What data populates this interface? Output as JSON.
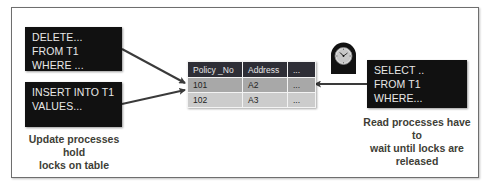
{
  "update_processes": {
    "boxes": [
      {
        "lines": [
          "DELETE...",
          "FROM T1",
          "WHERE ..."
        ]
      },
      {
        "lines": [
          "INSERT INTO T1",
          "VALUES..."
        ]
      }
    ],
    "caption_line1": "Update processes hold",
    "caption_line2": "locks on table"
  },
  "table": {
    "headers": [
      "Policy _No",
      "Address",
      "..."
    ],
    "rows": [
      [
        "101",
        "A2",
        "..."
      ],
      [
        "102",
        "A3",
        "..."
      ]
    ],
    "colors": {
      "header_bg": "#2e2e36",
      "row1_bg": "#a8a8a8",
      "row2_bg": "#cccccc"
    }
  },
  "read_process": {
    "box": {
      "lines": [
        "SELECT ..",
        "FROM T1",
        "WHERE..."
      ]
    },
    "caption_line1": "Read processes have to",
    "caption_line2": "wait until locks are",
    "caption_line3": "released",
    "icon": "clock-icon"
  },
  "colors": {
    "box_bg": "#111111",
    "box_text": "#e8e8e8",
    "caption": "#3e3e36",
    "arrow": "#3a3a3a"
  }
}
